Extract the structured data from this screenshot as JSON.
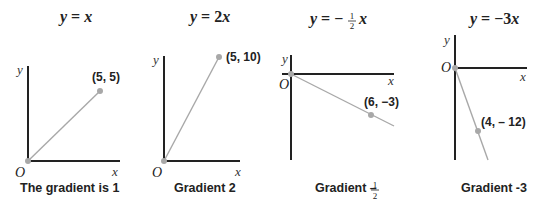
{
  "panels": [
    {
      "equation": "y = x",
      "equation_parts": {
        "y": "y",
        "eq": " = ",
        "rhs": "x"
      },
      "x_label": "x",
      "y_label": "y",
      "origin_label": "O",
      "point_label": "(5, 5)",
      "caption": "The gradient is 1",
      "gradient": 1
    },
    {
      "equation": "y = 2x",
      "equation_parts": {
        "y": "y",
        "eq": " = ",
        "coef": "2",
        "rhs": "x"
      },
      "x_label": "x",
      "y_label": "y",
      "origin_label": "O",
      "point_label": "(5, 10)",
      "caption": "Gradient 2",
      "gradient": 2
    },
    {
      "equation": "y = -1/2 x",
      "equation_parts": {
        "y": "y",
        "eq": " = −",
        "num": "1",
        "den": "2",
        "rhs": "x"
      },
      "x_label": "x",
      "y_label": "y",
      "origin_label": "O",
      "point_label": "(6, −3)",
      "caption": "Gradient –",
      "caption_num": "1",
      "caption_den": "2",
      "gradient": -0.5
    },
    {
      "equation": "y = -3x",
      "equation_parts": {
        "y": "y",
        "eq": " = −3",
        "rhs": "x"
      },
      "x_label": "x",
      "y_label": "y",
      "origin_label": "O",
      "point_label": "(4, – 12)",
      "caption": "Gradient -3",
      "gradient": -3
    }
  ],
  "colors": {
    "axis": "#222222",
    "line": "#a8a8a8",
    "text": "#222222"
  }
}
